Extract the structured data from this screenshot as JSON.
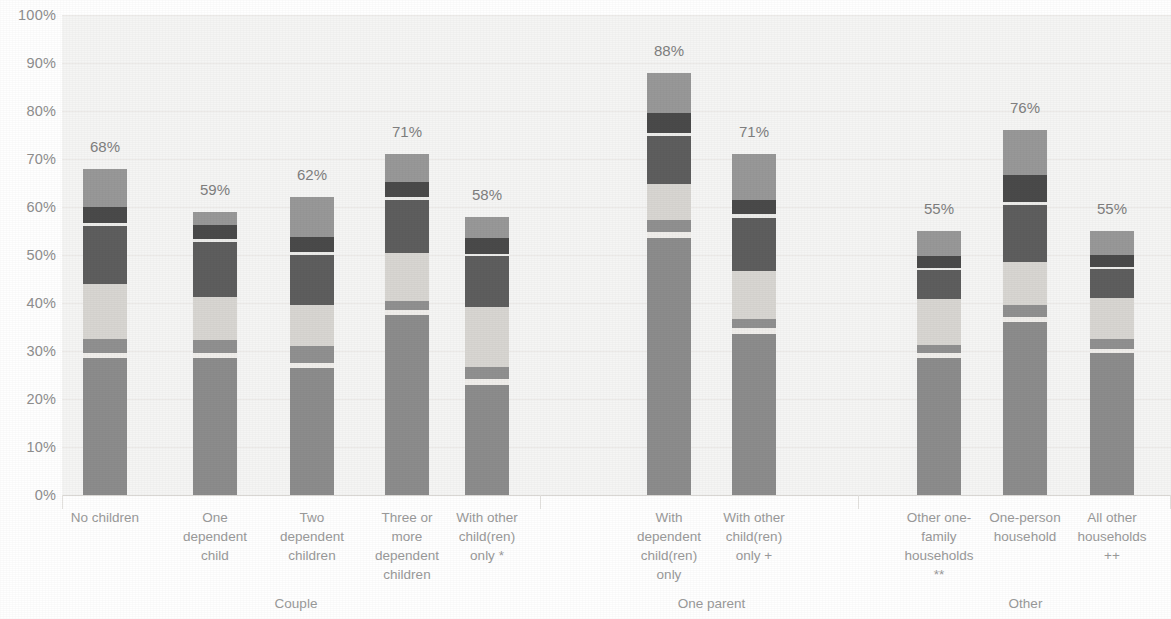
{
  "chart_data": {
    "type": "bar",
    "subtype": "stacked-bar",
    "title": "",
    "subtitle": "",
    "xlabel": "",
    "ylabel": "",
    "ylim": [
      0,
      100
    ],
    "grid": true,
    "legend_position": "none",
    "y_ticks": [
      "0%",
      "10%",
      "20%",
      "30%",
      "40%",
      "50%",
      "60%",
      "70%",
      "80%",
      "90%",
      "100%"
    ],
    "y_tick_values": [
      0,
      10,
      20,
      30,
      40,
      50,
      60,
      70,
      80,
      90,
      100
    ],
    "categories": [
      "No children",
      "One dependent child",
      "Two dependent children",
      "Three or more dependent children",
      "With other child(ren) only *",
      "With dependent child(ren) only",
      "With other child(ren) only +",
      "Other one-family households **",
      "One-person household",
      "All other households ++"
    ],
    "groups": [
      {
        "label": "Couple",
        "span": [
          0,
          4
        ]
      },
      {
        "label": "One parent",
        "span": [
          5,
          6
        ]
      },
      {
        "label": "Other",
        "span": [
          7,
          9
        ]
      }
    ],
    "totals": [
      68,
      59,
      62,
      71,
      58,
      88,
      71,
      55,
      76,
      55
    ],
    "total_labels": [
      "68%",
      "59%",
      "62%",
      "71%",
      "58%",
      "88%",
      "71%",
      "55%",
      "76%",
      "55%"
    ],
    "series": [
      {
        "name": "Series 1",
        "color": "#8c8c8c",
        "values": [
          28.5,
          28.5,
          26.5,
          37.5,
          23.0,
          53.5,
          33.5,
          28.5,
          36.0,
          29.5
        ]
      },
      {
        "name": "Series 2",
        "color": "#f0eeeb",
        "values": [
          1.0,
          1.0,
          1.0,
          1.0,
          1.2,
          1.2,
          1.2,
          1.0,
          1.0,
          1.0
        ]
      },
      {
        "name": "Series 3",
        "color": "#909090",
        "values": [
          3.0,
          2.8,
          3.5,
          2.0,
          2.5,
          2.5,
          2.0,
          1.8,
          2.5,
          2.0
        ]
      },
      {
        "name": "Series 4",
        "color": "#d8d6d2",
        "values": [
          11.5,
          9.0,
          8.5,
          10.0,
          12.5,
          7.5,
          10.0,
          9.5,
          9.0,
          8.5
        ]
      },
      {
        "name": "Series 5",
        "color": "#5e5e5e",
        "values": [
          12.0,
          11.5,
          10.5,
          11.0,
          10.5,
          10.0,
          11.0,
          6.0,
          12.0,
          6.0
        ]
      },
      {
        "name": "Series 6",
        "color": "#ececea",
        "values": [
          0.6,
          0.6,
          0.6,
          0.6,
          0.6,
          0.8,
          0.8,
          0.6,
          0.6,
          0.6
        ]
      },
      {
        "name": "Series 7",
        "color": "#4a4a4a",
        "values": [
          3.5,
          2.8,
          3.2,
          3.2,
          3.2,
          4.0,
          3.0,
          2.5,
          5.5,
          2.5
        ]
      },
      {
        "name": "Series 8",
        "color": "#989898",
        "values": [
          7.9,
          2.8,
          8.2,
          5.7,
          4.5,
          8.5,
          9.5,
          5.1,
          9.4,
          4.9
        ]
      }
    ]
  },
  "axis": {
    "label_0": "0%",
    "label_10": "10%",
    "label_20": "20%",
    "label_30": "30%",
    "label_40": "40%",
    "label_50": "50%",
    "label_60": "60%",
    "label_70": "70%",
    "label_80": "80%",
    "label_90": "90%",
    "label_100": "100%"
  },
  "bars": [
    {
      "value_label": "68%",
      "category": "No children",
      "group": "Couple"
    },
    {
      "value_label": "59%",
      "category": "One dependent child",
      "group": "Couple"
    },
    {
      "value_label": "62%",
      "category": "Two dependent children",
      "group": "Couple"
    },
    {
      "value_label": "71%",
      "category": "Three or more dependent children",
      "group": "Couple"
    },
    {
      "value_label": "58%",
      "category": "With other child(ren) only *",
      "group": "Couple"
    },
    {
      "value_label": "88%",
      "category": "With dependent child(ren) only",
      "group": "One parent"
    },
    {
      "value_label": "71%",
      "category": "With other child(ren) only +",
      "group": "One parent"
    },
    {
      "value_label": "55%",
      "category": "Other one-family households **",
      "group": "Other"
    },
    {
      "value_label": "76%",
      "category": "One-person household",
      "group": "Other"
    },
    {
      "value_label": "55%",
      "category": "All other households ++",
      "group": "Other"
    }
  ],
  "category_lines": [
    [
      "No children"
    ],
    [
      "One",
      "dependent",
      "child"
    ],
    [
      "Two",
      "dependent",
      "children"
    ],
    [
      "Three or",
      "more",
      "dependent",
      "children"
    ],
    [
      "With other",
      "child(ren)",
      "only *"
    ],
    [
      "With",
      "dependent",
      "child(ren)",
      "only"
    ],
    [
      "With other",
      "child(ren)",
      "only +"
    ],
    [
      "Other one-",
      "family",
      "households",
      "**"
    ],
    [
      "One-person",
      "household"
    ],
    [
      "All other",
      "households",
      "++"
    ]
  ],
  "group_labels": [
    "Couple",
    "One parent",
    "Other"
  ]
}
